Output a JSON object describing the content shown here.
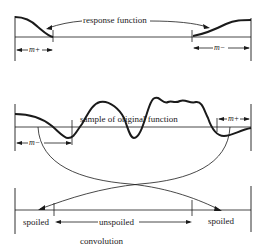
{
  "diagram": {
    "top_panel": {
      "label": "response function",
      "left_width_label": "m+",
      "right_width_label": "m−"
    },
    "middle_panel": {
      "label": "sample of original function",
      "left_width_label": "m−",
      "right_width_label": "m+"
    },
    "bottom_panel": {
      "left_label": "spoiled",
      "center_label": "unspoiled",
      "right_label": "spoiled",
      "caption": "convolution"
    },
    "colors": {
      "ink": "#1a1a1a",
      "background": "#ffffff"
    }
  }
}
